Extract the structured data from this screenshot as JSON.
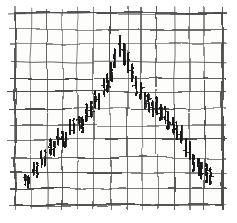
{
  "figure": {
    "width": 237,
    "height": 223,
    "background_color": "#ffffff",
    "ink_color": "#1a1a1a",
    "grid_color": "#4a4a4a",
    "paper_color": "#fdfdfb",
    "style": "hand-drawn pencil sketch on graph paper",
    "title": "",
    "subtitle": ""
  },
  "plot_area": {
    "left": 15,
    "top": 13,
    "right": 222,
    "bottom": 205,
    "grid_columns": 13,
    "grid_rows": 12,
    "grid_cell_width": 16,
    "grid_cell_height": 16,
    "grid_visible": true,
    "border_visible": true
  },
  "chart_data": {
    "type": "bar",
    "title": "",
    "subtitle": "",
    "xlabel": "",
    "ylabel": "",
    "xlim": [
      0,
      48
    ],
    "ylim": [
      0,
      12
    ],
    "grid": true,
    "legend": "none",
    "annotations": [],
    "series_label": "price range bars",
    "x": [
      1,
      2,
      3,
      4,
      5,
      6,
      7,
      8,
      9,
      10,
      11,
      12,
      13,
      14,
      15,
      16,
      17,
      18,
      19,
      20,
      21,
      22,
      23,
      24,
      25,
      26,
      27,
      28,
      29,
      30,
      31,
      32,
      33,
      34,
      35,
      36,
      37,
      38,
      39,
      40,
      41,
      42,
      43,
      44,
      45,
      46
    ],
    "categories": [
      "1",
      "2",
      "3",
      "4",
      "5",
      "6",
      "7",
      "8",
      "9",
      "10",
      "11",
      "12",
      "13",
      "14",
      "15",
      "16",
      "17",
      "18",
      "19",
      "20",
      "21",
      "22",
      "23",
      "24",
      "25",
      "26",
      "27",
      "28",
      "29",
      "30",
      "31",
      "32",
      "33",
      "34",
      "35",
      "36",
      "37",
      "38",
      "39",
      "40",
      "41",
      "42",
      "43",
      "44",
      "45",
      "46"
    ],
    "values": [
      1.6,
      1.5,
      2.3,
      2.2,
      2.9,
      3.0,
      3.7,
      3.6,
      4.3,
      4.2,
      4.1,
      4.9,
      5.0,
      5.2,
      5.1,
      5.8,
      5.9,
      6.6,
      6.5,
      7.3,
      7.6,
      8.3,
      9.1,
      9.9,
      9.4,
      8.9,
      8.2,
      7.4,
      7.1,
      6.6,
      6.4,
      6.0,
      6.2,
      5.8,
      5.6,
      5.2,
      5.0,
      4.6,
      4.4,
      3.6,
      3.4,
      2.6,
      2.4,
      2.2,
      2.0,
      1.8
    ],
    "series": [
      {
        "name": "high",
        "values": [
          1.9,
          1.8,
          2.7,
          2.6,
          3.3,
          3.4,
          4.1,
          4.0,
          4.7,
          4.6,
          4.5,
          5.3,
          5.4,
          5.6,
          5.5,
          6.3,
          6.4,
          7.1,
          7.0,
          7.9,
          8.2,
          8.9,
          9.7,
          10.5,
          10.0,
          9.5,
          8.8,
          8.0,
          7.6,
          7.1,
          6.9,
          6.5,
          6.7,
          6.3,
          6.1,
          5.7,
          5.5,
          5.1,
          4.9,
          4.1,
          3.9,
          3.1,
          2.9,
          2.7,
          2.5,
          2.3
        ]
      },
      {
        "name": "low",
        "values": [
          1.2,
          1.1,
          1.8,
          1.7,
          2.4,
          2.5,
          3.2,
          3.1,
          3.8,
          3.7,
          3.6,
          4.4,
          4.5,
          4.7,
          4.6,
          5.3,
          5.4,
          6.1,
          6.0,
          6.8,
          7.1,
          7.8,
          8.6,
          9.3,
          8.8,
          8.3,
          7.7,
          6.9,
          6.6,
          6.1,
          5.9,
          5.5,
          5.7,
          5.3,
          5.1,
          4.7,
          4.5,
          4.1,
          3.9,
          3.1,
          2.9,
          2.1,
          1.9,
          1.7,
          1.5,
          1.3
        ]
      }
    ]
  }
}
